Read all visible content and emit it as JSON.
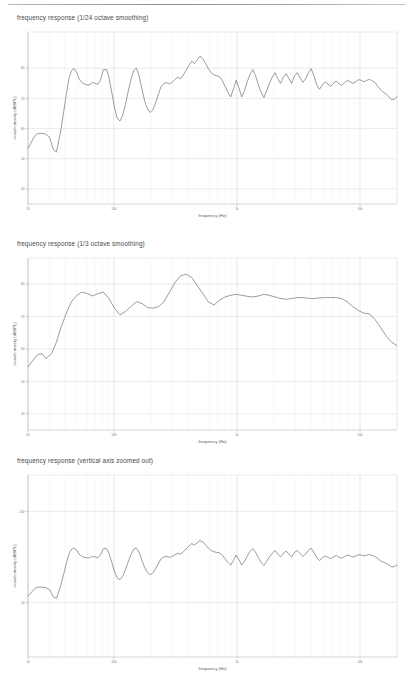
{
  "page": {
    "top_rule": "horizontal-rule"
  },
  "figures": [
    {
      "id": "fig-1-24-octave",
      "title": "frequency response (1/24 octave smoothing)",
      "xlabel": "frequency (Hz)",
      "ylabel": "sound intensity (dBSPL)"
    },
    {
      "id": "fig-1-3-octave",
      "title": "frequency response (1/3 octave smoothing)",
      "xlabel": "frequency (Hz)",
      "ylabel": "sound intensity (dBSPL)"
    },
    {
      "id": "fig-zoomed-out",
      "title": "frequency response (vertical axis zoomed out)",
      "xlabel": "frequency (Hz)",
      "ylabel": "sound intensity (dBSPL)"
    }
  ],
  "chart_data": [
    {
      "type": "line",
      "title": "frequency response (1/24 octave smoothing)",
      "xlabel": "frequency (Hz)",
      "ylabel": "sound intensity (dBSPL)",
      "xscale": "log",
      "xlim": [
        20,
        20000
      ],
      "ylim": [
        35,
        92
      ],
      "xticks": [
        20,
        100,
        1000,
        10000
      ],
      "xtick_labels": [
        "10",
        "100",
        "1k",
        "10k"
      ],
      "yticks": [
        80,
        70,
        60,
        50,
        40
      ],
      "ytick_labels": [
        "80",
        "70",
        "60",
        "50",
        "40"
      ],
      "grid": true,
      "legend": null,
      "series": [
        {
          "name": "1/24 octave smoothed response",
          "x": [
            20,
            21,
            22,
            23,
            24,
            25,
            26,
            27,
            28,
            30,
            31,
            32,
            34,
            35,
            37,
            39,
            41,
            43,
            45,
            47,
            50,
            52,
            55,
            58,
            61,
            64,
            67,
            71,
            74,
            78,
            82,
            87,
            91,
            96,
            101,
            106,
            112,
            118,
            124,
            130,
            137,
            145,
            152,
            160,
            169,
            178,
            187,
            197,
            207,
            218,
            230,
            242,
            255,
            269,
            283,
            298,
            314,
            331,
            348,
            367,
            386,
            407,
            429,
            452,
            476,
            501,
            528,
            556,
            586,
            617,
            650,
            684,
            721,
            759,
            800,
            843,
            888,
            935,
            985,
            1037,
            1092,
            1151,
            1212,
            1277,
            1345,
            1417,
            1492,
            1572,
            1656,
            1745,
            1838,
            1936,
            2039,
            2148,
            2263,
            2384,
            2511,
            2645,
            2786,
            2935,
            3092,
            3257,
            3431,
            3614,
            3807,
            4010,
            4225,
            4450,
            4688,
            4938,
            5202,
            5480,
            5773,
            6081,
            6406,
            6748,
            7109,
            7489,
            7889,
            8310,
            8754,
            9222,
            9714,
            10233,
            10780,
            11356,
            11962,
            12601,
            13274,
            13983,
            14730,
            15517,
            16346,
            17219,
            18139,
            19108,
            20000
          ],
          "y": [
            53.5,
            55.0,
            56.6,
            57.8,
            58.3,
            58.4,
            58.4,
            58.3,
            58.1,
            57.0,
            55.2,
            53.2,
            52.2,
            54.5,
            59.5,
            65.5,
            71.5,
            76.5,
            79.0,
            80.0,
            78.5,
            76.5,
            75.2,
            74.7,
            74.4,
            74.6,
            75.3,
            74.9,
            74.6,
            76.3,
            79.5,
            79.6,
            77.0,
            72.0,
            67.0,
            63.5,
            62.5,
            64.5,
            68.0,
            72.0,
            76.0,
            79.3,
            80.0,
            77.5,
            73.0,
            69.0,
            66.5,
            65.3,
            66.2,
            68.5,
            71.5,
            74.0,
            75.0,
            75.2,
            74.8,
            75.3,
            76.3,
            77.0,
            76.5,
            77.8,
            79.3,
            81.0,
            82.3,
            81.5,
            82.8,
            84.0,
            83.2,
            81.5,
            79.8,
            78.5,
            77.8,
            77.5,
            77.2,
            76.0,
            74.0,
            72.0,
            70.5,
            73.0,
            76.0,
            73.5,
            70.5,
            72.5,
            75.5,
            78.0,
            79.5,
            77.5,
            74.5,
            72.0,
            70.3,
            72.5,
            75.0,
            77.0,
            78.5,
            76.5,
            75.0,
            77.0,
            78.2,
            76.5,
            75.0,
            77.5,
            78.5,
            76.8,
            75.3,
            76.5,
            78.5,
            79.8,
            77.5,
            74.5,
            73.0,
            74.5,
            75.5,
            74.8,
            74.0,
            75.0,
            75.8,
            74.8,
            74.3,
            75.2,
            76.0,
            75.5,
            75.0,
            75.5,
            76.2,
            76.0,
            75.5,
            76.0,
            76.3,
            75.8,
            75.2,
            74.0,
            72.8,
            72.0,
            71.5,
            70.5,
            69.5,
            69.8,
            70.5,
            70.0,
            68.5,
            66.5,
            64.0,
            61.5,
            60.0,
            61.5
          ]
        }
      ]
    },
    {
      "type": "line",
      "title": "frequency response (1/3 octave smoothing)",
      "xlabel": "frequency (Hz)",
      "ylabel": "sound intensity (dBSPL)",
      "xscale": "log",
      "xlim": [
        20,
        20000
      ],
      "ylim": [
        35,
        88
      ],
      "xticks": [
        20,
        100,
        1000,
        10000
      ],
      "xtick_labels": [
        "10",
        "100",
        "1k",
        "10k"
      ],
      "yticks": [
        80,
        70,
        60,
        50,
        40
      ],
      "ytick_labels": [
        "80",
        "70",
        "60",
        "50",
        "40"
      ],
      "grid": true,
      "legend": null,
      "series": [
        {
          "name": "1/3 octave smoothed response",
          "x": [
            20,
            22,
            24,
            26,
            28,
            31,
            34,
            37,
            41,
            45,
            50,
            55,
            61,
            67,
            74,
            82,
            91,
            101,
            112,
            124,
            137,
            152,
            169,
            187,
            207,
            230,
            255,
            283,
            314,
            348,
            386,
            429,
            476,
            528,
            586,
            650,
            721,
            800,
            888,
            985,
            1092,
            1212,
            1345,
            1492,
            1656,
            1838,
            2039,
            2263,
            2511,
            2786,
            3092,
            3431,
            3807,
            4225,
            4688,
            5202,
            5773,
            6406,
            7109,
            7889,
            8754,
            9714,
            10780,
            11962,
            13274,
            14730,
            16346,
            18139,
            20000
          ],
          "y": [
            54.5,
            56.5,
            58.3,
            58.5,
            57.0,
            58.5,
            62.0,
            66.5,
            71.0,
            74.5,
            76.5,
            77.5,
            77.0,
            76.3,
            77.0,
            77.5,
            75.5,
            72.5,
            70.5,
            71.5,
            73.0,
            74.5,
            74.0,
            72.8,
            72.5,
            73.0,
            74.5,
            77.5,
            80.5,
            82.5,
            83.0,
            82.0,
            79.5,
            77.0,
            74.5,
            73.5,
            75.0,
            76.0,
            76.5,
            76.8,
            76.5,
            76.2,
            76.0,
            76.3,
            76.8,
            76.5,
            76.0,
            75.5,
            75.3,
            75.5,
            75.8,
            75.8,
            75.6,
            75.5,
            75.7,
            75.8,
            75.8,
            75.8,
            75.5,
            74.5,
            73.0,
            71.8,
            71.0,
            70.8,
            69.0,
            66.5,
            64.0,
            62.0,
            61.0
          ]
        }
      ]
    },
    {
      "type": "line",
      "title": "frequency response (vertical axis zoomed out)",
      "xlabel": "frequency (Hz)",
      "ylabel": "sound intensity (dBSPL)",
      "xscale": "log",
      "xlim": [
        20,
        20000
      ],
      "ylim": [
        20,
        120
      ],
      "xticks": [
        20,
        100,
        1000,
        10000
      ],
      "xtick_labels": [
        "10",
        "100",
        "1k",
        "10k"
      ],
      "yticks": [
        100,
        50
      ],
      "ytick_labels": [
        "100",
        "50"
      ],
      "grid": true,
      "legend": null,
      "series": [
        {
          "name": "response (zoomed out vertical axis)",
          "x": [
            20,
            21,
            22,
            23,
            24,
            25,
            26,
            27,
            28,
            30,
            31,
            32,
            34,
            35,
            37,
            39,
            41,
            43,
            45,
            47,
            50,
            52,
            55,
            58,
            61,
            64,
            67,
            71,
            74,
            78,
            82,
            87,
            91,
            96,
            101,
            106,
            112,
            118,
            124,
            130,
            137,
            145,
            152,
            160,
            169,
            178,
            187,
            197,
            207,
            218,
            230,
            242,
            255,
            269,
            283,
            298,
            314,
            331,
            348,
            367,
            386,
            407,
            429,
            452,
            476,
            501,
            528,
            556,
            586,
            617,
            650,
            684,
            721,
            759,
            800,
            843,
            888,
            935,
            985,
            1037,
            1092,
            1151,
            1212,
            1277,
            1345,
            1417,
            1492,
            1572,
            1656,
            1745,
            1838,
            1936,
            2039,
            2148,
            2263,
            2384,
            2511,
            2645,
            2786,
            2935,
            3092,
            3257,
            3431,
            3614,
            3807,
            4010,
            4225,
            4450,
            4688,
            4938,
            5202,
            5480,
            5773,
            6081,
            6406,
            6748,
            7109,
            7489,
            7889,
            8310,
            8754,
            9222,
            9714,
            10233,
            10780,
            11356,
            11962,
            12601,
            13274,
            13983,
            14730,
            15517,
            16346,
            17219,
            18139,
            19108,
            20000
          ],
          "y": [
            53.5,
            55.0,
            56.6,
            57.8,
            58.3,
            58.4,
            58.4,
            58.3,
            58.1,
            57.0,
            55.2,
            53.2,
            52.2,
            54.5,
            59.5,
            65.5,
            71.5,
            76.5,
            79.0,
            80.0,
            78.5,
            76.5,
            75.2,
            74.7,
            74.4,
            74.6,
            75.3,
            74.9,
            74.6,
            76.3,
            79.5,
            79.6,
            77.0,
            72.0,
            67.0,
            63.5,
            62.5,
            64.5,
            68.0,
            72.0,
            76.0,
            79.3,
            80.0,
            77.5,
            73.0,
            69.0,
            66.5,
            65.3,
            66.2,
            68.5,
            71.5,
            74.0,
            75.0,
            75.2,
            74.8,
            75.3,
            76.3,
            77.0,
            76.5,
            77.8,
            79.3,
            81.0,
            82.3,
            81.5,
            82.8,
            84.0,
            83.2,
            81.5,
            79.8,
            78.5,
            77.8,
            77.5,
            77.2,
            76.0,
            74.0,
            72.0,
            70.5,
            73.0,
            76.0,
            73.5,
            70.5,
            72.5,
            75.5,
            78.0,
            79.5,
            77.5,
            74.5,
            72.0,
            70.3,
            72.5,
            75.0,
            77.0,
            78.5,
            76.5,
            75.0,
            77.0,
            78.2,
            76.5,
            75.0,
            77.5,
            78.5,
            76.8,
            75.3,
            76.5,
            78.5,
            79.8,
            77.5,
            74.5,
            73.0,
            74.5,
            75.5,
            74.8,
            74.0,
            75.0,
            75.8,
            74.8,
            74.3,
            75.2,
            76.0,
            75.5,
            75.0,
            75.5,
            76.2,
            76.0,
            75.5,
            76.0,
            76.3,
            75.8,
            75.2,
            74.0,
            72.8,
            72.0,
            71.5,
            70.5,
            69.5,
            69.8,
            70.5,
            70.0,
            68.5,
            66.5,
            64.0,
            61.5,
            60.0,
            61.5
          ]
        }
      ]
    }
  ]
}
